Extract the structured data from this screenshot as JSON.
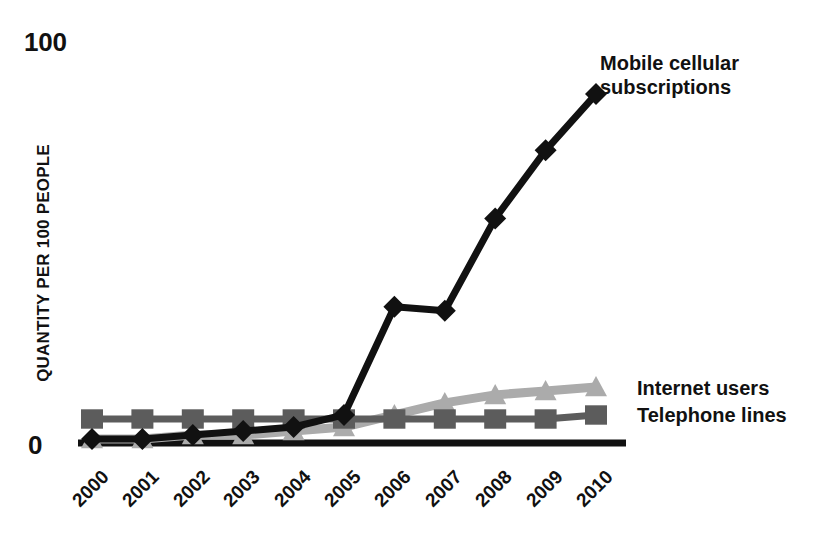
{
  "chart_data": {
    "type": "line",
    "title": "",
    "subtitle": "",
    "xlabel": "",
    "ylabel": "QUANTITY PER 100 PEOPLE",
    "categories": [
      "2000",
      "2001",
      "2002",
      "2003",
      "2004",
      "2005",
      "2006",
      "2007",
      "2008",
      "2009",
      "2010"
    ],
    "x": [
      2000,
      2001,
      2002,
      2003,
      2004,
      2005,
      2006,
      2007,
      2008,
      2009,
      2010
    ],
    "ylim": [
      0,
      100
    ],
    "xlim": [
      2000,
      2010
    ],
    "grid": false,
    "legend_position": "right-inline-annotations",
    "y_tick_labels": [
      "0",
      "100"
    ],
    "y_ticks": [
      0,
      100
    ],
    "series": [
      {
        "name": "Mobile cellular subscriptions",
        "marker": "diamond",
        "color": "#111111",
        "values": [
          1,
          1,
          2,
          3,
          4,
          7,
          34,
          33,
          56,
          73,
          87
        ]
      },
      {
        "name": "Internet users",
        "marker": "triangle",
        "color": "#ababab",
        "values": [
          1,
          1,
          2,
          2,
          3,
          4,
          7,
          10,
          12,
          13,
          14
        ]
      },
      {
        "name": "Telephone lines",
        "marker": "square",
        "color": "#5c5c5c",
        "values": [
          6,
          6,
          6,
          6,
          6,
          6,
          6,
          6,
          6,
          6,
          7
        ]
      }
    ]
  },
  "axis": {
    "top_value_label": "100",
    "zero_value_label": "0",
    "y_title": "QUANTITY PER 100 PEOPLE"
  },
  "annotations": {
    "mobile_line_1": "Mobile cellular",
    "mobile_line_2": "subscriptions",
    "internet": "Internet users",
    "telephone": "Telephone lines"
  },
  "colors": {
    "mobile": "#111111",
    "internet": "#ababab",
    "telephone": "#5c5c5c",
    "axis": "#111111",
    "background": "#ffffff"
  }
}
